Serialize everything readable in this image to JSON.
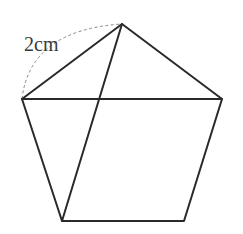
{
  "diagram": {
    "type": "pentagon-with-diagonals",
    "vertices": {
      "left": [
        22,
        99
      ],
      "top": [
        122,
        24
      ],
      "right": [
        222,
        99
      ],
      "bottom_right": [
        184,
        221
      ],
      "bottom_left": [
        62,
        221
      ]
    },
    "edges": [
      [
        "left",
        "top"
      ],
      [
        "top",
        "right"
      ],
      [
        "right",
        "bottom_right"
      ],
      [
        "bottom_right",
        "bottom_left"
      ],
      [
        "bottom_left",
        "left"
      ]
    ],
    "diagonals": [
      [
        "left",
        "right"
      ],
      [
        "top",
        "bottom_left"
      ]
    ],
    "arc": {
      "from": "left",
      "to": "top",
      "style": "dashed",
      "label": "2cm"
    },
    "colors": {
      "line": "#2a2a2a",
      "dashed_arc": "#8a8a8a",
      "label": "#3a3a3a",
      "background": "#ffffff"
    }
  }
}
